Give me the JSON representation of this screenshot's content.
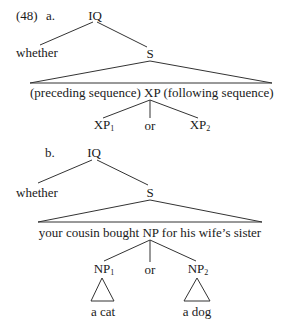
{
  "example_number": "(48)",
  "tree_a": {
    "label": "a.",
    "root": "IQ",
    "left_child": "whether",
    "right_child": "S",
    "s_content": {
      "preceding": "(preceding sequence)",
      "head": "XP",
      "following": "(following sequence)"
    },
    "xp_children": {
      "left": "XP",
      "left_sub": "1",
      "middle": "or",
      "right": "XP",
      "right_sub": "2"
    }
  },
  "tree_b": {
    "label": "b.",
    "root": "IQ",
    "left_child": "whether",
    "right_child": "S",
    "s_content": "your cousin bought NP for his wife’s sister",
    "np_children": {
      "left": "NP",
      "left_sub": "1",
      "left_leaf": "a cat",
      "middle": "or",
      "right": "NP",
      "right_sub": "2",
      "right_leaf": "a dog"
    }
  }
}
